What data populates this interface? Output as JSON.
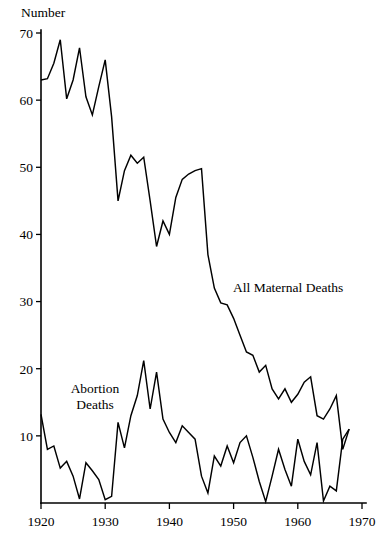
{
  "axis": {
    "y_title": "Number",
    "y_ticks": [
      0,
      10,
      20,
      30,
      40,
      50,
      60,
      70
    ],
    "y_tick_labels": [
      "",
      "10",
      "20",
      "30",
      "40",
      "50",
      "60",
      "70"
    ],
    "x_ticks": [
      1920,
      1930,
      1940,
      1950,
      1960,
      1970
    ],
    "x_tick_labels": [
      "1920",
      "1930",
      "1940",
      "1950",
      "1960",
      "1970"
    ]
  },
  "labels": {
    "all_maternal": "All Maternal Deaths",
    "abortion_line1": "Abortion",
    "abortion_line2": "Deaths"
  },
  "colors": {
    "line": "#000000",
    "axis": "#000000",
    "background": "#ffffff"
  },
  "chart_data": {
    "type": "line",
    "title": "",
    "xlabel": "",
    "ylabel": "Number",
    "xlim": [
      1920,
      1970
    ],
    "ylim": [
      0,
      70
    ],
    "grid": false,
    "legend": "inline-annotations",
    "x": [
      1920,
      1921,
      1922,
      1923,
      1924,
      1925,
      1926,
      1927,
      1928,
      1929,
      1930,
      1931,
      1932,
      1933,
      1934,
      1935,
      1936,
      1937,
      1938,
      1939,
      1940,
      1941,
      1942,
      1943,
      1944,
      1945,
      1946,
      1947,
      1948,
      1949,
      1950,
      1951,
      1952,
      1953,
      1954,
      1955,
      1956,
      1957,
      1958,
      1959,
      1960,
      1961,
      1962,
      1963,
      1964,
      1965,
      1966,
      1967,
      1968
    ],
    "series": [
      {
        "name": "All Maternal Deaths",
        "values": [
          63.0,
          63.2,
          65.5,
          69.0,
          60.2,
          63.0,
          67.8,
          60.5,
          57.8,
          62.0,
          66.0,
          57.5,
          45.0,
          49.5,
          51.8,
          50.6,
          51.5,
          45.0,
          38.2,
          42.0,
          40.0,
          45.5,
          48.2,
          49.0,
          49.5,
          49.8,
          37.0,
          32.0,
          29.8,
          29.5,
          27.5,
          25.0,
          22.5,
          22.0,
          19.5,
          20.5,
          17.0,
          15.5,
          17.0,
          15.0,
          16.2,
          18.0,
          18.8,
          13.0,
          12.5,
          14.0,
          16.0,
          8.0,
          11.0
        ]
      },
      {
        "name": "Abortion Deaths",
        "values": [
          13.2,
          8.0,
          8.5,
          5.2,
          6.2,
          4.0,
          0.6,
          6.0,
          4.8,
          3.5,
          0.5,
          1.0,
          12.0,
          8.2,
          13.0,
          16.0,
          21.2,
          14.0,
          19.5,
          12.5,
          10.5,
          9.0,
          11.5,
          10.5,
          9.5,
          4.0,
          1.5,
          7.0,
          5.5,
          8.5,
          6.0,
          9.0,
          10.0,
          6.8,
          3.2,
          0.2,
          4.0,
          8.0,
          5.0,
          2.5,
          9.5,
          6.2,
          4.2,
          9.0,
          0.3,
          2.5,
          1.8,
          9.5,
          11.0
        ]
      }
    ]
  },
  "plot_geometry": {
    "left": 41,
    "right": 362,
    "top_value": 70,
    "y_top_px": 33,
    "y_zero_px": 503
  }
}
